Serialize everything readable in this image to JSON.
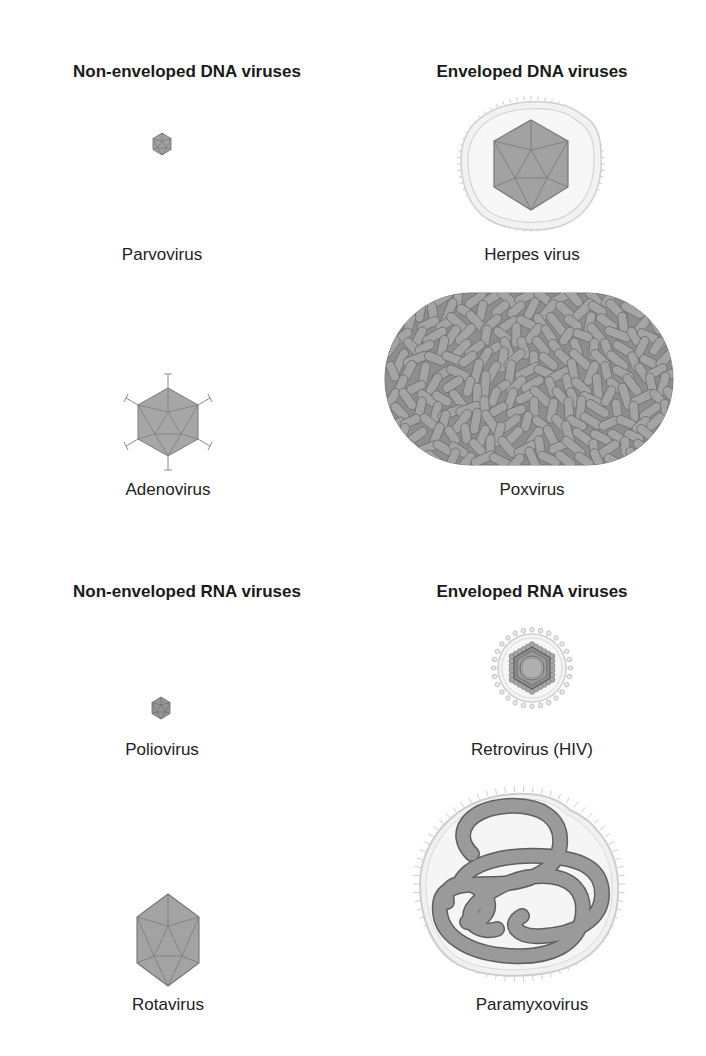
{
  "colors": {
    "capsid_fill": "#9a9a9a",
    "capsid_stroke": "#6e6e6e",
    "envelope_fill": "#efefef",
    "envelope_stroke": "#c8c8c8",
    "text": "#1a1a1a"
  },
  "sections": [
    {
      "heading": "Non-enveloped DNA viruses",
      "viruses": [
        {
          "name": "Parvovirus",
          "shape": "icosahedron-small"
        },
        {
          "name": "Adenovirus",
          "shape": "icosahedron-with-fibers"
        }
      ]
    },
    {
      "heading": "Enveloped DNA viruses",
      "viruses": [
        {
          "name": "Herpes virus",
          "shape": "enveloped-icosahedron"
        },
        {
          "name": "Poxvirus",
          "shape": "oval-brick"
        }
      ]
    },
    {
      "heading": "Non-enveloped RNA viruses",
      "viruses": [
        {
          "name": "Poliovirus",
          "shape": "icosahedron-small"
        },
        {
          "name": "Rotavirus",
          "shape": "icosahedron-medium"
        }
      ]
    },
    {
      "heading": "Enveloped RNA viruses",
      "viruses": [
        {
          "name": "Retrovirus (HIV)",
          "shape": "enveloped-spherical-core"
        },
        {
          "name": "Paramyxovirus",
          "shape": "enveloped-helical-nucleocapsid"
        }
      ]
    }
  ]
}
